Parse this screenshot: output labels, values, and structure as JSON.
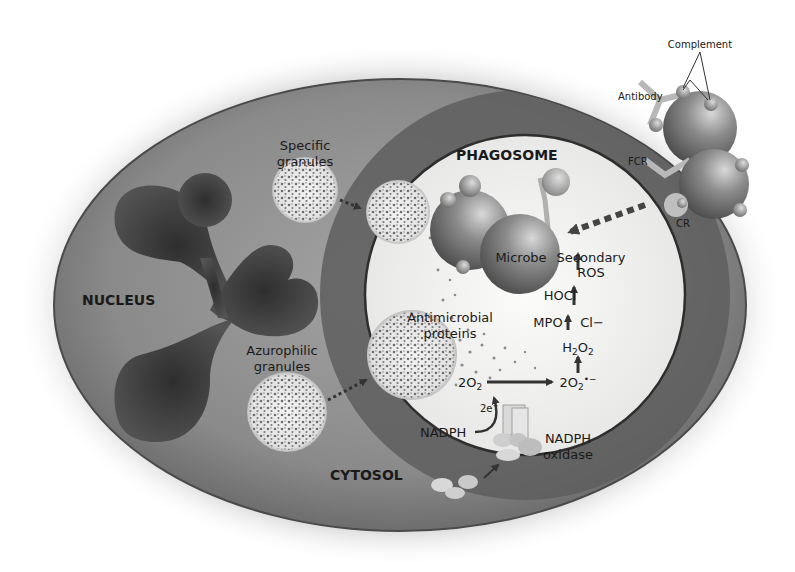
{
  "diagram": {
    "type": "biological-illustration",
    "compartments": {
      "nucleus": "NUCLEUS",
      "phagosome": "PHAGOSOME",
      "cytosol": "CYTOSOL"
    },
    "granules": {
      "specific": [
        "Specific",
        "granules"
      ],
      "azurophilic": [
        "Azurophilic",
        "granules"
      ],
      "antimicrobial": [
        "Antimicrobial",
        "proteins"
      ]
    },
    "opsonization": {
      "complement": "Complement",
      "antibody": "Antibody",
      "fcr": "FCR",
      "cr": "CR"
    },
    "microbe": "Microbe",
    "ros_pathway": {
      "secondary_ros": [
        "Secondary",
        "ROS"
      ],
      "hocl": "HOCl",
      "mpo": "MPO",
      "cl": "Cl−",
      "h2o2": "H2O2",
      "o2": "2O2",
      "superoxide": "2O2•−",
      "electrons": "2e−",
      "nadph": "NADPH",
      "nadph_oxidase": [
        "NADPH",
        "oxidase"
      ]
    },
    "colors": {
      "cell_fill_center": "#9a9a9a",
      "cell_fill_edge": "#6a6a6a",
      "phagosome_ring": "#5c5c5c",
      "phagosome_fill": "#f2f2f0",
      "nucleus": "#3c3c3c",
      "text": "#1a1a1a"
    }
  }
}
